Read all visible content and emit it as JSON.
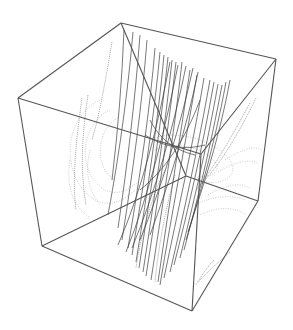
{
  "figure": {
    "type": "3d-streamline-plot",
    "box": {
      "vertices": {
        "top_back": [
          121,
          23
        ],
        "top_right": [
          276,
          59
        ],
        "top_left": [
          18,
          98
        ],
        "top_front": [
          201,
          154
        ],
        "bottom_left": [
          42,
          246
        ],
        "bottom_front": [
          192,
          311
        ],
        "bottom_right": [
          258,
          201
        ],
        "bottom_back": [
          186,
          176
        ]
      },
      "edges": [
        [
          "top_back",
          "top_right"
        ],
        [
          "top_back",
          "top_left"
        ],
        [
          "top_left",
          "top_front"
        ],
        [
          "top_right",
          "top_front"
        ],
        [
          "top_left",
          "bottom_left"
        ],
        [
          "top_front",
          "bottom_front"
        ],
        [
          "top_right",
          "bottom_right"
        ],
        [
          "bottom_left",
          "bottom_front"
        ],
        [
          "bottom_front",
          "bottom_right"
        ],
        [
          "top_back",
          "bottom_back"
        ],
        [
          "bottom_back",
          "bottom_right"
        ],
        [
          "bottom_back",
          "bottom_left"
        ]
      ],
      "edge_color": "#555555"
    },
    "streamlines": {
      "dark_color": "#3a3a3a",
      "mid_color": "#777777",
      "light_color": "#aaaaaa",
      "dark": [
        "M133 32 C128 90 120 150 108 215",
        "M140 35 C135 100 128 160 118 228",
        "M147 40 C142 105 133 170 122 240",
        "M155 48 C150 110 140 175 128 248",
        "M160 52 C154 118 144 182 132 255",
        "M164 55 C158 120 148 188 136 262",
        "M168 57 C161 125 150 195 139 268",
        "M172 60 C165 128 154 200 143 272",
        "M176 62 C168 132 157 205 146 276",
        "M182 62 C174 135 162 208 151 280",
        "M190 70 C180 140 168 210 158 282",
        "M197 75 C186 140 172 212 160 285",
        "M204 78 C193 145 178 210 164 278",
        "M210 80 C198 148 184 212 170 272",
        "M214 82 C202 150 188 210 174 265",
        "M218 84 C206 152 192 208 180 258",
        "M222 85 C210 150 196 205 184 250",
        "M226 82 C214 148 198 200 186 240",
        "M230 80 C218 145 200 195 188 232",
        "M198 72 C186 130 170 180 150 235",
        "M193 68 C180 128 162 185 140 240",
        "M186 66 C174 125 156 190 132 248",
        "M178 65 C166 125 150 192 126 252",
        "M170 62 C158 125 142 190 118 245",
        "M124 30 C122 80 118 130 112 180",
        "M200 100 C185 140 165 170 140 190",
        "M150 120 C160 140 175 150 195 155",
        "M145 135 C165 148 185 150 205 145"
      ],
      "mid": [
        "M112 42 C104 90 98 120 92 140",
        "M82 98 C76 140 72 180 76 210",
        "M88 95 C82 135 80 170 86 205",
        "M165 170 C150 200 140 240 136 268",
        "M175 175 C165 210 158 250 155 282",
        "M250 103 C230 140 212 170 196 190",
        "M256 98 C238 135 218 168 200 185",
        "M214 260 C205 270 200 278 196 285",
        "M230 252 C218 262 208 272 198 282"
      ],
      "light": [
        "M100 100 C60 120 62 180 95 200 C110 208 125 200 135 190",
        "M110 110 C78 125 78 175 105 190 C118 196 128 190 138 182",
        "M118 118 C95 130 95 170 115 180",
        "M150 140 C175 128 215 140 230 160 C240 176 222 185 205 182",
        "M155 150 C175 140 205 148 215 162 C222 172 210 178 198 176",
        "M225 160 C240 150 255 145 262 150",
        "M218 172 C235 162 250 158 258 164",
        "M208 195 C225 185 240 182 250 188",
        "M195 205 C215 195 232 195 245 200",
        "M90 150 C85 170 88 190 100 205",
        "M70 160 C66 185 72 205 90 218",
        "M200 215 C220 205 238 208 246 215"
      ]
    }
  }
}
